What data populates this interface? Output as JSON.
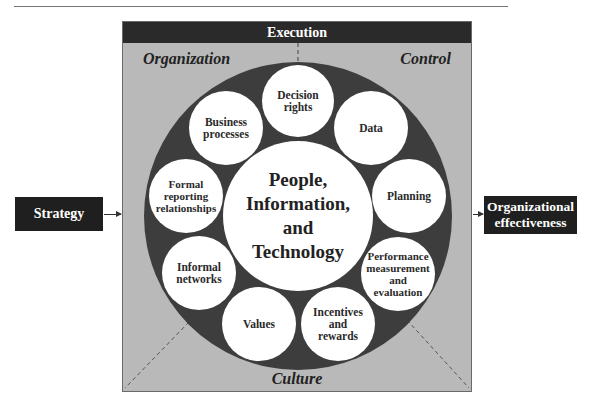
{
  "diagram": {
    "header": {
      "label": "Execution"
    },
    "corners": {
      "top_left": "Organization",
      "top_right": "Control",
      "bottom": "Culture"
    },
    "input": {
      "label": "Strategy"
    },
    "output": {
      "label": "Organizational\neffectiveness"
    },
    "center": {
      "label": "People,\nInformation,\nand\nTechnology"
    },
    "nodes": [
      {
        "id": "decision-rights",
        "label": "Decision\nrights",
        "cx": 297,
        "cy": 100
      },
      {
        "id": "data",
        "label": "Data",
        "cx": 370,
        "cy": 127
      },
      {
        "id": "planning",
        "label": "Planning",
        "cx": 408,
        "cy": 195
      },
      {
        "id": "performance",
        "label": "Performance\nmeasurement\nand\nevaluation",
        "cx": 397,
        "cy": 273
      },
      {
        "id": "incentives",
        "label": "Incentives\nand\nrewards",
        "cx": 337,
        "cy": 323
      },
      {
        "id": "values",
        "label": "Values",
        "cx": 258,
        "cy": 323
      },
      {
        "id": "informal-networks",
        "label": "Informal\nnetworks",
        "cx": 198,
        "cy": 272
      },
      {
        "id": "formal-reporting",
        "label": "Formal\nreporting\nrelationships",
        "cx": 185,
        "cy": 195
      },
      {
        "id": "business-processes",
        "label": "Business\nprocesses",
        "cx": 225,
        "cy": 127
      }
    ],
    "colors": {
      "frame_fill": "#b9b9b9",
      "ring_fill": "#3d3d3d",
      "node_fill": "#ffffff",
      "header_fill": "#2a2a2a",
      "box_fill": "#1f1f1f"
    }
  }
}
